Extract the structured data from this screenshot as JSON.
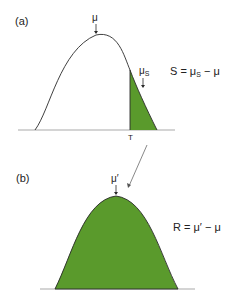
{
  "panel_a": {
    "label": "(a)",
    "mean_label": "μ",
    "selected_mean_label": "μ",
    "selected_mean_sub": "S",
    "threshold_label": "T",
    "equation_lhs": "S = μ",
    "equation_sub": "S",
    "equation_rhs": " − μ"
  },
  "panel_b": {
    "label": "(b)",
    "mean_label": "μ′",
    "equation": "R = μ′ − μ"
  },
  "colors": {
    "fill": "#5a9a2c",
    "stroke": "#2a2a2a",
    "baseline": "#aaaaaa"
  }
}
